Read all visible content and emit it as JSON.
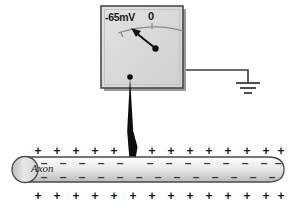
{
  "figure": {
    "background_color": "#ffffff"
  },
  "voltmeter": {
    "name": "voltmeter",
    "scale_labels": {
      "left": "-65mV",
      "right": "0"
    },
    "body_color": "#d9d9d9",
    "border_color": "#4a4a4a",
    "shadow_color": "#9a9a9a",
    "needle_reading": "-65mV",
    "needle_color": "#1a1a1a"
  },
  "electrode": {
    "name": "recording-electrode",
    "color": "#0d0d0d",
    "tip_label": ""
  },
  "ground": {
    "name": "ground-symbol",
    "wire_color": "#3a3a3a",
    "bars": 3
  },
  "axon": {
    "label": "Axon",
    "fill_start": "#f7f7f7",
    "fill_end": "#c9c9c9",
    "outline_color": "#4a4a4a",
    "outside_charge": "+",
    "inside_charge": "–",
    "outside_top_count": 14,
    "outside_bottom_count": 14,
    "inside_top_count": 14,
    "inside_bottom_count": 14,
    "charge_color_outside": "#141414",
    "charge_color_inside": "#3a3a3a"
  }
}
